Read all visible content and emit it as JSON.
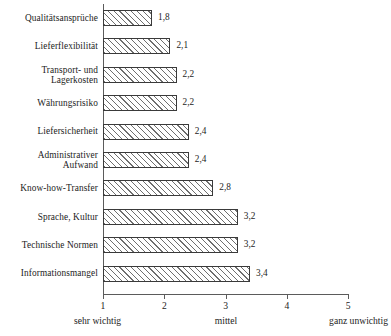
{
  "chart_data": {
    "type": "bar",
    "orientation": "horizontal",
    "title": "",
    "subtitle": "",
    "xlabel": "",
    "ylabel": "",
    "xlim": [
      1,
      5
    ],
    "grid": false,
    "legend": null,
    "xticks": [
      "1",
      "2",
      "3",
      "4",
      "5"
    ],
    "xtick_values": [
      1,
      2,
      3,
      4,
      5
    ],
    "scale_anchors": {
      "left": "sehr wichtig",
      "center": "mittel",
      "right": "ganz unwichtig"
    },
    "categories": [
      "Qualitätsansprüche",
      "Lieferflexibilität",
      "Transport- und\nLagerkosten",
      "Währungsrisiko",
      "Liefersicherheit",
      "Administrativer\nAufwand",
      "Know-how-Transfer",
      "Sprache, Kultur",
      "Technische Normen",
      "Informationsmangel"
    ],
    "values": [
      1.8,
      2.1,
      2.2,
      2.2,
      2.4,
      2.4,
      2.8,
      3.2,
      3.2,
      3.4
    ],
    "value_labels": [
      "1,8",
      "2,1",
      "2,2",
      "2,2",
      "2,4",
      "2,4",
      "2,8",
      "3,2",
      "3,2",
      "3,4"
    ],
    "bar_style": {
      "fill": "#ffffff",
      "hatch": "/",
      "hatch_color": "#6e6e6e",
      "edge_color": "#3a3a3a"
    },
    "axis_color": "#5b5b5b"
  }
}
